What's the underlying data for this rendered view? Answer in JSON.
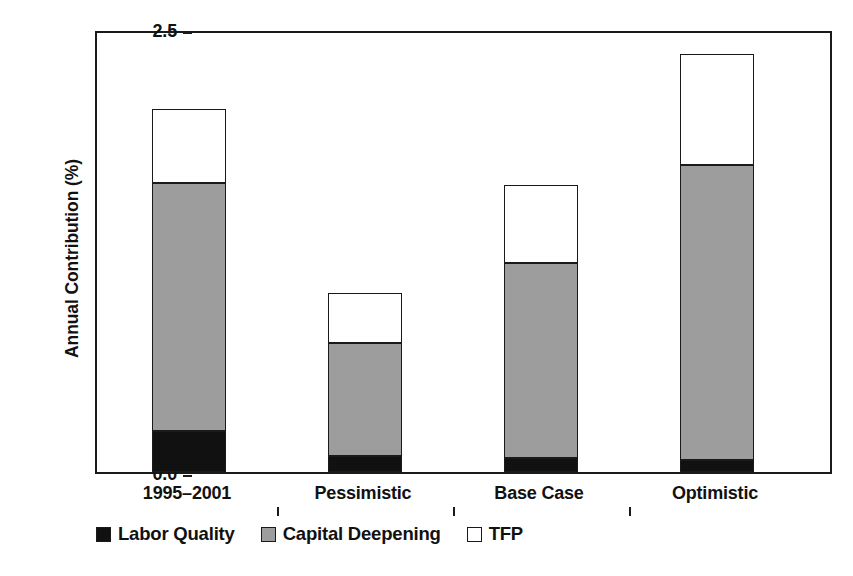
{
  "chart_data": {
    "type": "bar",
    "subtype": "stacked-bar",
    "title": "",
    "xlabel": "",
    "ylabel": "Annual Contribution (%)",
    "ylim": [
      0.0,
      2.5
    ],
    "ytick_labels": [
      "0.0",
      "0.5",
      "1.0",
      "1.5",
      "2.0",
      "2.5"
    ],
    "ytick_values": [
      0.0,
      0.5,
      1.0,
      1.5,
      2.0,
      2.5
    ],
    "grid": false,
    "legend_position": "bottom-left",
    "categories": [
      "1995–2001",
      "Pessimistic",
      "Base Case",
      "Optimistic"
    ],
    "series": [
      {
        "name": "Labor Quality",
        "color": "#111111",
        "values": [
          0.23,
          0.09,
          0.08,
          0.07
        ]
      },
      {
        "name": "Capital Deepening",
        "color": "#9d9d9d",
        "values": [
          1.4,
          0.64,
          1.1,
          1.66
        ]
      },
      {
        "name": "TFP",
        "color": "#ffffff",
        "values": [
          0.42,
          0.28,
          0.44,
          0.63
        ]
      }
    ],
    "totals": [
      2.05,
      1.01,
      1.62,
      2.36
    ],
    "cumulative_tops": [
      {
        "labor": 0.23,
        "capital": 1.63,
        "tfp": 2.05
      },
      {
        "labor": 0.09,
        "capital": 0.73,
        "tfp": 1.01
      },
      {
        "labor": 0.08,
        "capital": 1.18,
        "tfp": 1.62
      },
      {
        "labor": 0.07,
        "capital": 1.73,
        "tfp": 2.36
      }
    ]
  },
  "axis": {
    "y_title": "Annual Contribution (%)"
  },
  "legend": {
    "items": [
      {
        "label": "Labor Quality"
      },
      {
        "label": "Capital Deepening"
      },
      {
        "label": "TFP"
      }
    ]
  },
  "colors": {
    "labor_quality": "#111111",
    "capital_deepening": "#9d9d9d",
    "tfp": "#ffffff",
    "axis": "#1a1a1a",
    "background": "#ffffff"
  }
}
